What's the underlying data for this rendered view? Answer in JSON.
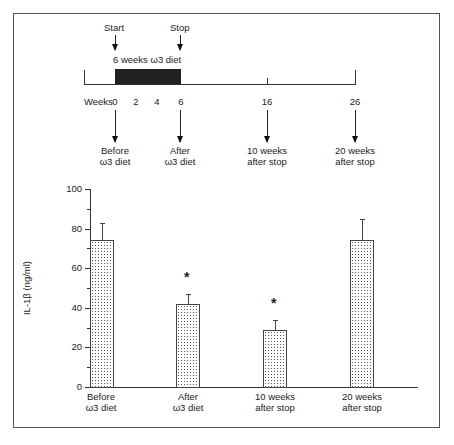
{
  "timeline": {
    "start_label": "Start",
    "stop_label": "Stop",
    "diet_label": "6 weeks ω3 diet",
    "weeks_label": "Weeks",
    "week_ticks": [
      "0",
      "2",
      "4",
      "6",
      "16",
      "26"
    ],
    "timepoints": [
      {
        "line1": "Before",
        "line2": "ω3 diet"
      },
      {
        "line1": "After",
        "line2": "ω3 diet"
      },
      {
        "line1": "10 weeks",
        "line2": "after stop"
      },
      {
        "line1": "20 weeks",
        "line2": "after stop"
      }
    ]
  },
  "chart_data": {
    "type": "bar",
    "title": "",
    "xlabel": "",
    "ylabel": "IL-1β (ng/ml)",
    "ylim": [
      0,
      100
    ],
    "yticks": [
      "0",
      "20",
      "40",
      "60",
      "80",
      "100"
    ],
    "grid": false,
    "categories": [
      "Before ω3 diet",
      "After ω3 diet",
      "10 weeks after stop",
      "20 weeks after stop"
    ],
    "values": [
      74,
      42,
      29,
      74
    ],
    "error_upper": [
      83,
      47,
      34,
      85
    ],
    "significance": [
      "",
      "*",
      "*",
      ""
    ],
    "asterisk": "*"
  }
}
